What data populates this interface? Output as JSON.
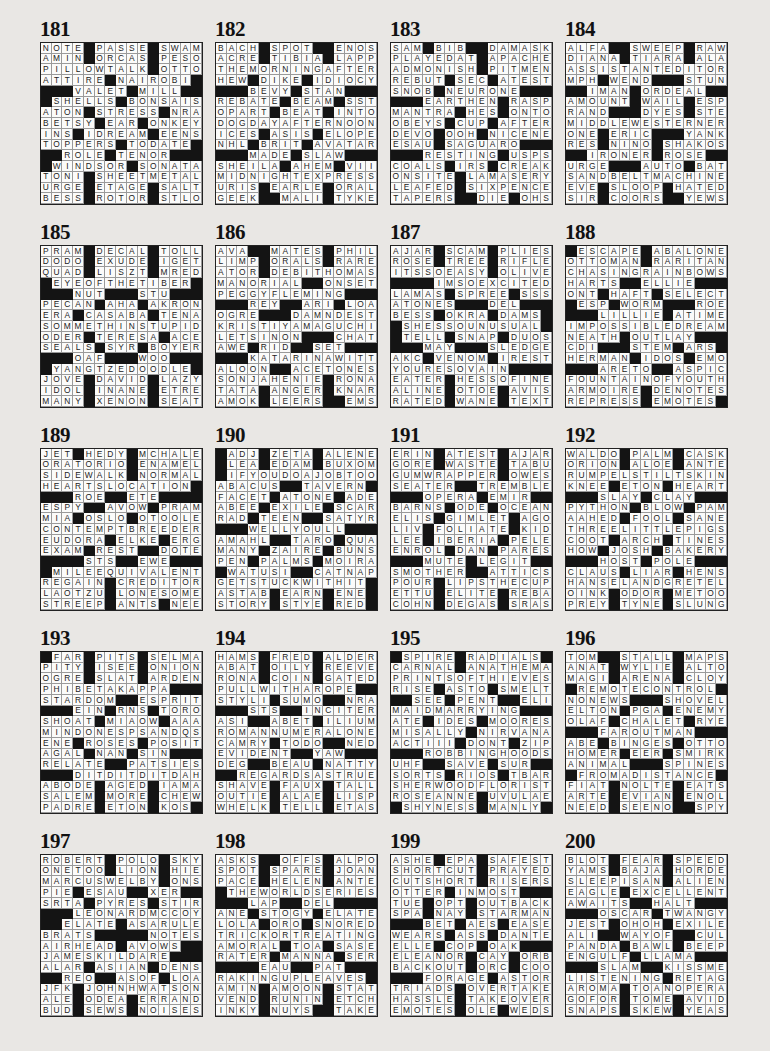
{
  "puzzles": [
    {
      "number": "181",
      "rows": [
        "NOTE#PASSE#SWAM",
        "AMIN#ORCAS#PESO",
        "PILLOWTALK#OTTO",
        "ATTIRE#NAIROBI#",
        "###VALET#MILL##",
        "#SHELLS#BONSAIS",
        "ATON#STRESS#NRA",
        "BETSY#EAR#ONKEY",
        "INS#IDREAM#EENS",
        "TOPPERS#TODATE#",
        "##ROLE#TENOR###",
        "#WINDSOR#SONATA",
        "TONI#SHEETMETAL",
        "URGE#ETAGE#SALT",
        "BESS#ROTOR#STLO"
      ]
    },
    {
      "number": "182",
      "rows": [
        "BACH#SPOT##ENOS",
        "ACRE#TIBIA#LAPP",
        "THEMORNINGAFTER",
        "HEW#DIKE#IDIOCY",
        "###BEVY#STAN###",
        "REBATE#BEAM#SST",
        "OPART#BEAT#INTO",
        "DOGDAYAFTERNOON",
        "ICES#ASIS#ELOPE",
        "NHL#BRIT#AVATAR",
        "###MADE#SLAW###",
        "SHEILA#AHEM#VII",
        "MIDNIGHTEXPRESS",
        "URIS#EARLE#ORAL",
        "GEEK##MALI#TYKE"
      ]
    },
    {
      "number": "183",
      "rows": [
        "SAM#BIB##DAMASK",
        "PLAYEDAT#APACHE",
        "ADMONISH#PITMEN",
        "REBUT#SEC#ATEST",
        "SNOB#NEURONE###",
        "###EARTHEN#RASP",
        "MANTRA#HES#ONTO",
        "OBEYS#CUP#AFTER",
        "DEVO#OOH#NICENE",
        "ESAU#SAGUARO###",
        "###RESTING#USPS",
        "COALS#IRS#CREAK",
        "ONSITE#LAMASERY",
        "LEAFED#SIXPENCE",
        "TAPERS##DIE#OHS"
      ]
    },
    {
      "number": "184",
      "rows": [
        "ALFA##SWEEP#RAW",
        "DIANA#TIARA#ALA",
        "ASSISTANTEDITOR",
        "MPH#WEND###STUN",
        "##IMAN#ORDEAL##",
        "AMOUNT#WAIL#ESP",
        "RAND###DYES#STE",
        "MIDDLEWESTERNER",
        "ONE#ERIC###YANK",
        "RES#NINO#SHAKOS",
        "##IRONER#ROSE##",
        "URGE###AUTO#BAT",
        "SANDBELTMACHINE",
        "EVE#SLOOP#HATED",
        "SIR#COORS##YEWS"
      ]
    },
    {
      "number": "185",
      "rows": [
        "PRAM#DECAL#TOLL",
        "DODO#EXUDE#IGET",
        "QUAD#LISZT#MRED",
        "#EYEOFTHETIBER#",
        "###NUT###STU###",
        "PECAN#AHA#AKRON",
        "ERA#CASABA#TENA",
        "SOMMETHINSTUPID",
        "ODER#TERESA#ACE",
        "SEALS#SYR#BOYER",
        "###OAF###WOO###",
        "#YANGTZEDOODLE#",
        "JOVE#DAVID#LAZY",
        "IDOL#INANE#ETRE",
        "MANY#XENON#SEAT"
      ]
    },
    {
      "number": "186",
      "rows": [
        "AVA##MATES#PHIL",
        "LIMP#ORALS#RARE",
        "ATOR#DEBITHOMAS",
        "MANORIAL##ONSET",
        "PEGGYFLEMING###",
        "###REY##ARI#LOA",
        "OGRE###DAMNDEST",
        "KRISTIYAMAGUCHI",
        "LETSINON###CHAT",
        "AWE#RID##SET###",
        "###KATARINAWITT",
        "ALOON##ACETONES",
        "SONJAHENIE#RONA",
        "TATA#ANGER#KNAR",
        "AMOK#LEERS##EMS"
      ]
    },
    {
      "number": "187",
      "rows": [
        "AJAR#SCAM#PLIES",
        "ROSE#TREE#RIFLE",
        "ITSSOEASY#OLIVE",
        "####IMSOEXCITED",
        "LAMAS#SPREE#SSS",
        "ATONES###DEL###",
        "BESS#OKRA#DAMS#",
        "#SHESSOUNUSUAL#",
        "#TELL#SNAP#DUOS",
        "###MAY###SLEDGE",
        "AKC#VENOM#IREST",
        "YOURESOVAIN####",
        "EATER#HESSOFINE",
        "ALINE#OTOE#AVIS",
        "RATED#WANE#TEXT"
      ]
    },
    {
      "number": "188",
      "rows": [
        "#ESCAPE#ABALONE",
        "OTTOMAN#RARITAN",
        "CHASINGRAINBOWS",
        "HARTS##ELLIE###",
        "ONT#HAFT#SELECT",
        "#ESP#WORM###ROE",
        "###LILLIE#ATIME",
        "IMPOSSIBLEDREAM",
        "NEATH#OUTLAY###",
        "CDI###STEM#ARS#",
        "HERMAN#IDOS#EMO",
        "###ARETO##ASPIC",
        "FOUNTAINOFYOUTH",
        "ARMOIRE#DENOTES",
        "REPRESS#EMOTES#"
      ]
    },
    {
      "number": "189",
      "rows": [
        "JET#HEDY#MCHALE",
        "ORATORIO#ENAMEL",
        "SIDEWALK#NORMAL",
        "HEARTSLOCATION#",
        "###ROE##ETE####",
        "ESPY##AVOW#PRAM",
        "MIA#OSLO#OTOOLE",
        "CONTEMPTBREEDER",
        "EUDORA#ELKE#ERG",
        "EXAM#REST##DOTE",
        "####STS##EWE###",
        "#MILEEQUIVALENT",
        "REGAIN#CREDITOR",
        "LAOTZU#LONESOME",
        "STREEP#ANTS#NEE"
      ]
    },
    {
      "number": "190",
      "rows": [
        "#ADJ#ZETA#ALENE",
        "#LEA#EDAM#BUXOM",
        "#IFYOUDOAJOBTOO",
        "ABACUS##TAVERN#",
        "FACET#ATONE#ADE",
        "ABEE#EXILE#SCAR",
        "RAD#TEEN##SATYR",
        "###WELLYOULL###",
        "AMAHL##TARO#QUA",
        "MANY#ZAIRE#BUNS",
        "PEN#PALMS#MOIRA",
        "#WATUSI##CATNAP",
        "GETSTUCKWITHIT#",
        "ASTAB#EARN#ENE#",
        "STORY#STYE#RED#"
      ]
    },
    {
      "number": "191",
      "rows": [
        "ERIN#ATEST#AJAR",
        "GORE#WASTE#TABU",
        "GUMWRAPPER#OWES",
        "SEATER##TREMBLE",
        "###OPERA#EMIR##",
        "BARNS#ODE#OCEAN",
        "ELIS#GIMLET#AGO",
        "LIV#FOLIATE#KID",
        "LEE#IBERIA#PELE",
        "ENROL#DAN#PARES",
        "###MUTE#LEGIT##",
        "SMOTHER##ATTICS",
        "POUR#LIPSTHECUP",
        "ETTU#ELITE#REBA",
        "COHN#DEGAS#SRAS"
      ]
    },
    {
      "number": "192",
      "rows": [
        "WALDO#PALM#CASK",
        "ORION#ALOE#ANTE",
        "RUMPELSTILTSKIN",
        "KNEE#ETON#HEART",
        "###SLAY#CLAY###",
        "PYTHON#BLOW#PAM",
        "AAHED#FOOL#SANE",
        "THREELITTLEPIGS",
        "COOT#ARCH#TINES",
        "HOW#JOSH#BAKERY",
        "###HOST#POLE###",
        "CLAUS#LIAR#HENS",
        "HANSELANDGRETEL",
        "OINK#ODOR#METOO",
        "PREY#TYNE#SLUNG"
      ]
    },
    {
      "number": "193",
      "rows": [
        "#FAR#PITS#SELMA",
        "PITY#ISEE#ONION",
        "OGRE#SLAT#ARDEN",
        "PHIBETAKAPPA###",
        "STARDOM##ESPRIT",
        "###EIN#RNS#TORO",
        "SHOAT#MIAOW#AAA",
        "MINDONESPSANDQS",
        "ENE#ROSES#POSIT",
        "AGAL#NAN#SIN###",
        "RELATE##PATSIES",
        "###DITDITDITDAH",
        "ABODE#AGED#IAMA",
        "SALEM#MORE#CHEW",
        "PADRE#ETON#KOS#"
      ]
    },
    {
      "number": "194",
      "rows": [
        "HAMS#FRED#ALDER",
        "ABAT#OILY#REEVE",
        "RONA#COIN#GATED",
        "PULLWITHAROPE##",
        "STYLI#SUMO##NRA",
        "###STS##INCITER",
        "ASI##ABET#ILIUM",
        "ROMANNUMERALONE",
        "CAMRY#TODO##NED",
        "EVIDENT##YAW###",
        "DEG##BEAU#NATTY",
        "##REGARDSASTRUE",
        "SHAVE#FAUX#TALL",
        "OUTIE#ALAE#LISP",
        "WHELK#TELL#ETAS"
      ]
    },
    {
      "number": "195",
      "rows": [
        "#SPIRE#RADIALS#",
        "CARNAL#ANATHEMA",
        "PRINTSOFTHIEVES",
        "RISE#ASTO#SMELT",
        "##SEE#PENT##ELI",
        "MAIDMARRYING###",
        "ATE#IDES#MOORES",
        "MISALLY#NIRVANA",
        "ACTIII#DONT#ZIP",
        "###ROBBINGHOODS",
        "UHF##SAVE#SUR##",
        "SORTS#RIOS#TBAR",
        "SHERWOODFLORIST",
        "ROSEANNE#UVULAE",
        "#SHYNESS#MANLY#"
      ]
    },
    {
      "number": "196",
      "rows": [
        "TOM##STALL#MAPS",
        "ANAT#WYLIE#ALTO",
        "MAGI#ARENA#CLOY",
        "#REMOTECONTROL#",
        "NONEWS###SHOVEL",
        "ELTON#PGA#ENEMY",
        "OLAF#CHALET#RYE",
        "###FAROUTMAN###",
        "ABE#BINGES#OTTO",
        "HOMER#EER#SMIRK",
        "ANIMAL###SPINES",
        "#FROMADISTANCE#",
        "FIAT#NOLTE#EATS",
        "ARTE#EVIAN#ENOL",
        "NEED#SEENO##SPY"
      ]
    },
    {
      "number": "197",
      "rows": [
        "ROBERT#POLO#SKY",
        "ONETOO#LION#HIE",
        "MARCUSWELBY#ONS",
        "PIE#ESAU##XER##",
        "SRTA#PYRES#STIR",
        "###LEONARDMCCOY",
        "##ELATE#ASARULE",
        "BRATS#####NOTES",
        "AIRHEAD#AVOWS##",
        "JAMESKILDARE###",
        "ALAR#ASIAN#DENS",
        "##REO##ASOF#LOA",
        "JFK#JOHNHWATSON",
        "ALE#ODEA#ERRAND",
        "BUD#SEWS#NOISES"
      ]
    },
    {
      "number": "198",
      "rows": [
        "ASKS##OFFS#ALPO",
        "SPOT#SPARE#JOAN",
        "PACE#HELEN#ANTE",
        "#THEWORLDSERIES",
        "###LAP##DEL####",
        "ANE#STOGY#ELATE",
        "LOLA#ORO#SNORED",
        "TRICKORTREATING",
        "AMORAL#TOA#SASE",
        "RATER#MANNA#SER",
        "####EAU##PAT###",
        "RAKINGUPLEAVES#",
        "AMIN#AMOON#STAT",
        "VEND#RUNIN#ETCH",
        "INKY#NUYS##TAKE"
      ]
    },
    {
      "number": "199",
      "rows": [
        "ASHE#EPA#SAFEST",
        "SHORTCUT#PRAYED",
        "CUTSHORT#RISERS",
        "OTTER#INMOST###",
        "TUE#OPT#OUTBACK",
        "SPA#NAY#STARMAN",
        "###BET#AES#EASE",
        "WEARS#ASS#DANTE",
        "ELLE#COP#OAK###",
        "ELEANOR#CAY#ORB",
        "BACKOUT#ORC#COO",
        "###FORAGE#ASTOR",
        "TRIADS#OVERTAKE",
        "HASSLE#TAKEOVER",
        "EMOTES#OLE#WEDS"
      ]
    },
    {
      "number": "200",
      "rows": [
        "BLOT#FEAR#SPEED",
        "YAMS#BAJA#HORDE",
        "SLEEPISAN#ALIEN",
        "EAGLE#EXCELLENT",
        "AWAITS##HALT###",
        "###OSCAR#TWANGY",
        "JEST#OHOH#EXILE",
        "ALI##WAYOF##CUL",
        "PANDA#BAWL#BEEP",
        "ENGULF#LLAMA###",
        "###SLAM##KISSME",
        "LISTENING#RETAG",
        "AROMA#TOANOPERA",
        "GOFOR#TOME#AVID",
        "SNAPS#SKEW#YEAS"
      ]
    }
  ],
  "colors": {
    "block": "#141414",
    "cell": "#fbfbfa",
    "page": "#e9e7e4"
  }
}
